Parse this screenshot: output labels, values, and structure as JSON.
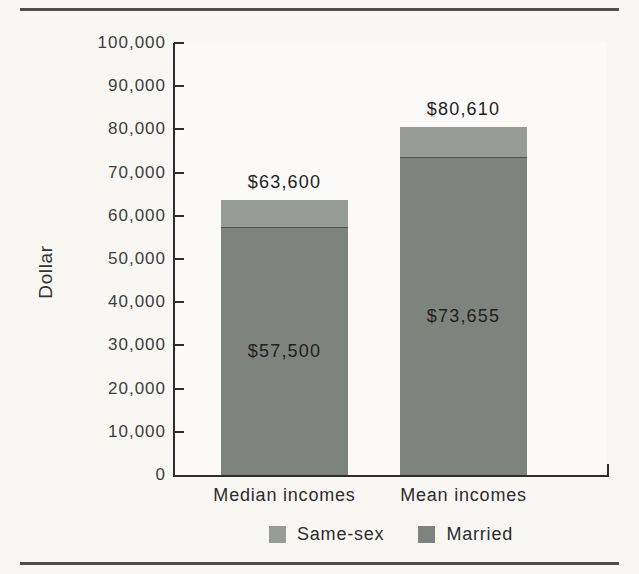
{
  "figure": {
    "kind": "scanned-book-figure",
    "rules": {
      "top": true,
      "bottom": true
    }
  },
  "chart_data": {
    "type": "bar",
    "stacked": true,
    "title": "",
    "xlabel": "",
    "ylabel": "Dollar",
    "ylim": [
      0,
      100000
    ],
    "y_tick_interval": 10000,
    "y_tick_labels": [
      "100,000",
      "90,000",
      "80,000",
      "70,000",
      "60,000",
      "50,000",
      "40,000",
      "30,000",
      "20,000",
      "10,000",
      "0"
    ],
    "categories": [
      "Median incomes",
      "Mean incomes"
    ],
    "series": [
      {
        "name": "Married",
        "color": "#7f837e",
        "values": [
          57500,
          73655
        ],
        "data_labels": [
          "$57,500",
          "$73,655"
        ],
        "label_position": "inside"
      },
      {
        "name": "Same-sex",
        "color": "#989c96",
        "values": [
          6100,
          6955
        ],
        "cumulative_totals": [
          63600,
          80610
        ],
        "data_labels": [
          "$63,600",
          "$80,610"
        ],
        "label_position": "above-bar"
      }
    ],
    "legend": [
      {
        "label": "Same-sex",
        "color": "#989c96"
      },
      {
        "label": "Married",
        "color": "#7f837e"
      }
    ],
    "legend_position": "bottom",
    "grid": false,
    "axis_color": "#2e2e2e",
    "tick_direction": "inward"
  }
}
